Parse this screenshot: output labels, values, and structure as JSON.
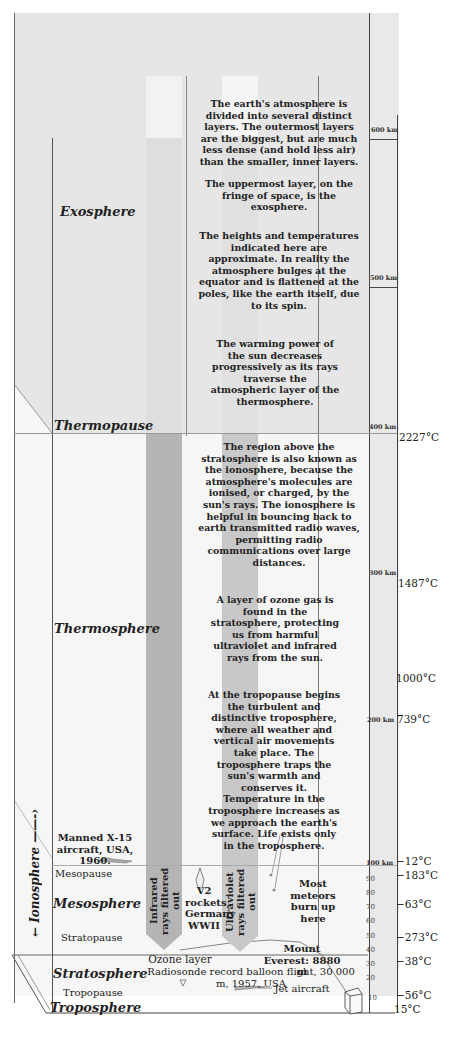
{
  "layers": {
    "exosphere": "Exosphere",
    "thermopause": "Thermopause",
    "thermosphere": "Thermosphere",
    "mesopause": "Mesopause",
    "mesosphere": "Mesosphere",
    "stratopause": "Stratopause",
    "stratosphere": "Stratosphere",
    "tropopause": "Tropopause",
    "troposphere": "Troposphere",
    "ionosphere": "Ionosphere"
  },
  "descriptions": [
    "The earth's atmosphere is divided into several distinct layers. The outermost layers are the biggest, but are much less dense (and hold less air) than the smaller, inner layers.",
    "The uppermost layer, on the fringe of space, is the exosphere.",
    "The heights and temperatures indicated here are approximate. In reality the atmosphere bulges at the equator and is flattened at the poles, like the earth itself, due to its spin.",
    "The warming power of the sun decreases progressively as its rays traverse the atmospheric layer of the thermosphere.",
    "The region above the stratosphere is also known as the ionosphere, because the atmosphere's molecules are ionised, or charged, by the sun's rays. The ionosphere is helpful in bouncing back to earth transmitted radio waves, permitting radio communications over large distances.",
    "A layer of ozone gas is found in the stratosphere, protecting us from harmful ultraviolet and infrared rays from the sun.",
    "At the tropopause begins the turbulent and distinctive troposphere, where all weather and vertical air movements take place. The troposphere traps the sun's warmth and conserves it. Temperature in the troposphere increases as we approach the earth's surface. Life exists only in the troposphere."
  ],
  "altitude_scale": {
    "km_600": "600 km",
    "km_500": "500 km",
    "km_400": "400 km",
    "km_300": "300 km",
    "km_200": "200 km",
    "km_100": "100 km",
    "ticks": [
      "90",
      "80",
      "70",
      "60",
      "50",
      "40",
      "30",
      "20",
      "10"
    ]
  },
  "temperatures": {
    "t400": "2227°C",
    "t300": "1487°C",
    "t250": "1000°C",
    "t200": "739°C",
    "t100": "−12°C",
    "t90": "−183°C",
    "t75": "−63°C",
    "t50": "−273°C",
    "t33": "−38°C",
    "t12": "−56°C",
    "t0": "15°C"
  },
  "annotations": {
    "x15": "Manned X-15 aircraft, USA, 1960.",
    "v2": "V2 rockets, Germany WWII",
    "meteors": "Most meteors burn up here",
    "everest": "Mount Everest: 8880 m",
    "ozone": "Ozone layer",
    "radiosonde": "Radiosonde record balloon flight, 30 000 m, 1957, USA",
    "jet": "Jet aircraft",
    "infrared": "Infrared rays filtered out",
    "ultraviolet": "Ultraviolet rays filtered out"
  }
}
